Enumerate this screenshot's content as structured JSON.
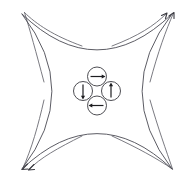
{
  "figure": {
    "background_color": "#ffffff",
    "width": 194,
    "height": 183,
    "outline": {
      "name": "astroid-outline",
      "stroke_color": "#4a4a52",
      "stroke_width": 0.9,
      "description": "Four concave arcs joining four outward corner points",
      "corners": [
        {
          "name": "top-left",
          "x": 22,
          "y": 14
        },
        {
          "name": "top-right",
          "x": 172,
          "y": 14
        },
        {
          "name": "bottom-right",
          "x": 172,
          "y": 169
        },
        {
          "name": "bottom-left",
          "x": 22,
          "y": 169
        }
      ],
      "arcs": [
        {
          "name": "top-arc",
          "from": "top-left",
          "to": "top-right",
          "control_x": 97,
          "control_y": 86
        },
        {
          "name": "right-arc",
          "from": "top-right",
          "to": "bottom-right",
          "control_x": 112,
          "control_y": 91
        },
        {
          "name": "bottom-arc",
          "from": "bottom-right",
          "to": "bottom-left",
          "control_x": 97,
          "control_y": 98
        },
        {
          "name": "left-arc",
          "from": "bottom-left",
          "to": "top-left",
          "control_x": 82,
          "control_y": 91
        }
      ]
    },
    "corner_rays": {
      "name": "corner-ray-group",
      "stroke_color": "#6b6b73",
      "count": 8,
      "arrowheads_at": [
        "top-right",
        "bottom-left"
      ],
      "arrowhead_color": "#3a3a40",
      "rays": [
        {
          "name": "ray-top-left-a",
          "corner": "top-left",
          "has_arrowhead": false
        },
        {
          "name": "ray-top-left-b",
          "corner": "top-left",
          "has_arrowhead": false
        },
        {
          "name": "ray-top-right-a",
          "corner": "top-right",
          "has_arrowhead": true
        },
        {
          "name": "ray-top-right-b",
          "corner": "top-right",
          "has_arrowhead": true
        },
        {
          "name": "ray-bottom-right-a",
          "corner": "bottom-right",
          "has_arrowhead": false
        },
        {
          "name": "ray-bottom-right-b",
          "corner": "bottom-right",
          "has_arrowhead": false
        },
        {
          "name": "ray-bottom-left-a",
          "corner": "bottom-left",
          "has_arrowhead": true
        },
        {
          "name": "ray-bottom-left-b",
          "corner": "bottom-left",
          "has_arrowhead": true
        }
      ]
    },
    "spin_cluster": {
      "name": "spin-cluster",
      "description": "Four circles in a diamond arrangement, each containing a single arrow; arrows circulate clockwise forming a vortex",
      "circle_fill": "#ffffff",
      "circle_stroke": "#3a3a40",
      "arrow_color": "#1d1d20",
      "center_x": 97,
      "center_y": 91,
      "radius": 9.5,
      "offset": 11.5,
      "circles": [
        {
          "name": "spin-top",
          "position": "top",
          "cx": 97,
          "cy": 76.5,
          "arrow_direction": "right",
          "arrow_angle_deg": 0
        },
        {
          "name": "spin-left",
          "position": "left",
          "cx": 83,
          "cy": 91,
          "arrow_direction": "down",
          "arrow_angle_deg": 90
        },
        {
          "name": "spin-right",
          "position": "right",
          "cx": 111,
          "cy": 91,
          "arrow_direction": "up",
          "arrow_angle_deg": 270
        },
        {
          "name": "spin-bottom",
          "position": "bottom",
          "cx": 97,
          "cy": 105.5,
          "arrow_direction": "left",
          "arrow_angle_deg": 180
        }
      ]
    }
  }
}
